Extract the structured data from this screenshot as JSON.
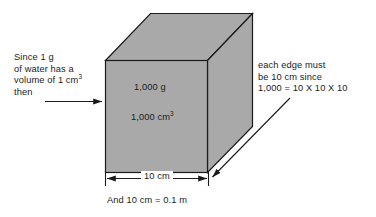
{
  "diagram": {
    "cube": {
      "fill_color": "#a9a9a9",
      "stroke_color": "#1a1a1a",
      "face_labels": {
        "mass": "1,000 g",
        "volume_value": "1,000 cm",
        "volume_exponent": "3"
      }
    },
    "left_note": {
      "line1": "Since 1 g",
      "line2": "of water has a",
      "line3_pre": "volume of 1 cm",
      "line3_exponent": "3",
      "line4": "then",
      "arrow": "left-note-arrow"
    },
    "right_note": {
      "line1": "each edge must",
      "line2": "be 10 cm since",
      "line3": "1,000 = 10 X 10 X 10",
      "arrow": "right-note-arrow"
    },
    "dimension": {
      "label": "10 cm",
      "arrow": "double-headed-arrow"
    },
    "caption": "And 10 cm = 0.1 m"
  }
}
